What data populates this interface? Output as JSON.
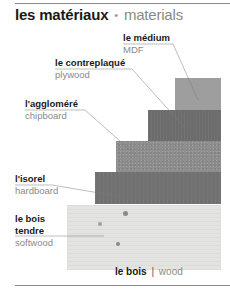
{
  "title": {
    "french": "les matériaux",
    "separator": "•",
    "english": "materials"
  },
  "materials": [
    {
      "french": "le médium",
      "english": "MDF",
      "color": "#9e9e9e"
    },
    {
      "french": "le contreplaqué",
      "english": "plywood",
      "color": "#6c6c6c"
    },
    {
      "french": "l'aggloméré",
      "english": "chipboard",
      "color": "#8e8e8e"
    },
    {
      "french": "l'isorel",
      "english": "hardboard",
      "color": "#717171"
    },
    {
      "french": "le bois tendre",
      "french_line1": "le bois",
      "french_line2": "tendre",
      "english": "softwood",
      "color": "#e3e3e1"
    }
  ],
  "caption": {
    "french": "le bois",
    "separator": "|",
    "english": "wood"
  }
}
